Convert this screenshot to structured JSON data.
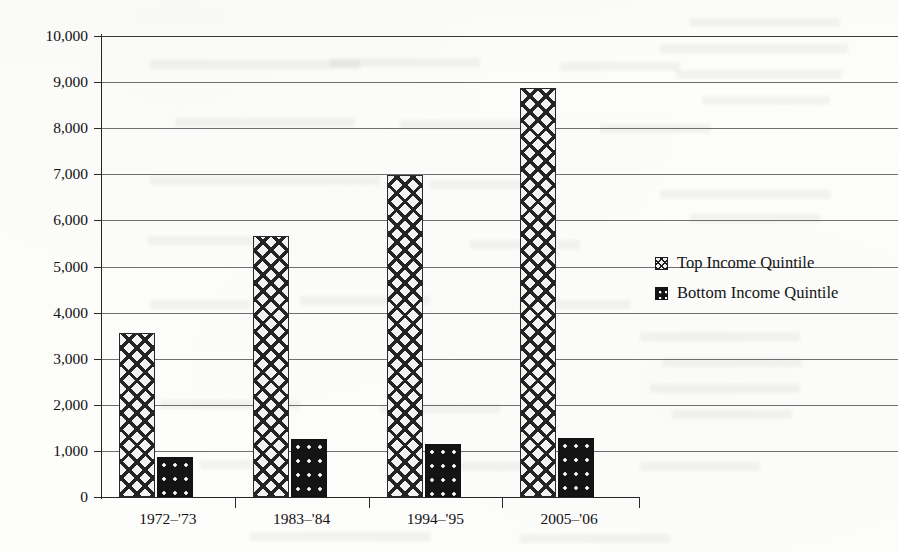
{
  "chart_data": {
    "type": "bar",
    "title": "",
    "subtitle": "",
    "xlabel": "",
    "ylabel": "",
    "categories": [
      "1972–'73",
      "1983–'84",
      "1994–'95",
      "2005–'06"
    ],
    "series": [
      {
        "name": "Top Income Quintile",
        "pattern": "diagonal-crosshatch",
        "values": [
          3560,
          5660,
          6990,
          8870
        ]
      },
      {
        "name": "Bottom Income Quintile",
        "pattern": "dark-dotted",
        "values": [
          870,
          1250,
          1150,
          1280
        ]
      }
    ],
    "ylim": [
      0,
      10000
    ],
    "ytick_values": [
      0,
      1000,
      2000,
      3000,
      4000,
      5000,
      6000,
      7000,
      8000,
      9000,
      10000
    ],
    "ytick_labels": [
      "0",
      "1,000",
      "2,000",
      "3,000",
      "4,000",
      "5,000",
      "6,000",
      "7,000",
      "8,000",
      "9,000",
      "10,000"
    ],
    "grid": true,
    "grid_axis": "y",
    "legend_position": "right",
    "colors": {
      "axis": "#262626",
      "gridline": "#6f6f6f",
      "top_quintile_fill": "#f2f2f0",
      "top_quintile_hatch": "#242424",
      "bottom_quintile_fill": "#141414",
      "bottom_quintile_dots": "#ffffff",
      "text": "#111111",
      "page_background": "#fdfdfc"
    }
  },
  "legend": {
    "items": [
      {
        "label": "Top Income Quintile",
        "swatch": "crosshatch-swatch-icon"
      },
      {
        "label": "Bottom Income Quintile",
        "swatch": "dotted-swatch-icon"
      }
    ]
  }
}
